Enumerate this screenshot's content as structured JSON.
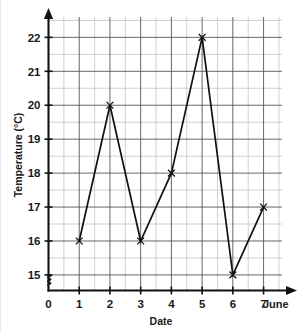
{
  "chart_data": {
    "type": "line",
    "title": "",
    "xlabel": "Date",
    "ylabel": "Temperature (°C)",
    "x_end_label": "June",
    "x": [
      1,
      2,
      3,
      4,
      5,
      6,
      7
    ],
    "values": [
      16,
      20,
      16,
      18,
      22,
      15,
      17
    ],
    "series": [
      {
        "name": "Temperature",
        "values": [
          16,
          20,
          16,
          18,
          22,
          15,
          17
        ]
      }
    ],
    "xlim": [
      0,
      7.6
    ],
    "ylim": [
      14.6,
      22.6
    ],
    "x_tick_labels": [
      "0",
      "1",
      "2",
      "3",
      "4",
      "5",
      "6",
      "7"
    ],
    "x_tick_values": [
      0,
      1,
      2,
      3,
      4,
      5,
      6,
      7
    ],
    "y_tick_labels": [
      "15",
      "16",
      "17",
      "18",
      "19",
      "20",
      "21",
      "22"
    ],
    "y_tick_values": [
      15,
      16,
      17,
      18,
      19,
      20,
      21,
      22
    ],
    "grid": true,
    "grid_minor_step_x": 0.5,
    "grid_minor_step_y": 0.5,
    "legend": "none",
    "marker": "x-cross",
    "y_axis_break": true,
    "line_color": "#111111",
    "grid_major_color": "#54565c",
    "grid_minor_color": "#b9bcc4",
    "axis_color": "#111111",
    "background_color": "#ffffff",
    "data_labels": [
      {
        "x": 1,
        "y": 16
      },
      {
        "x": 2,
        "y": 20
      },
      {
        "x": 3,
        "y": 16
      },
      {
        "x": 4,
        "y": 18
      },
      {
        "x": 5,
        "y": 22
      },
      {
        "x": 6,
        "y": 15
      },
      {
        "x": 7,
        "y": 17
      }
    ]
  }
}
